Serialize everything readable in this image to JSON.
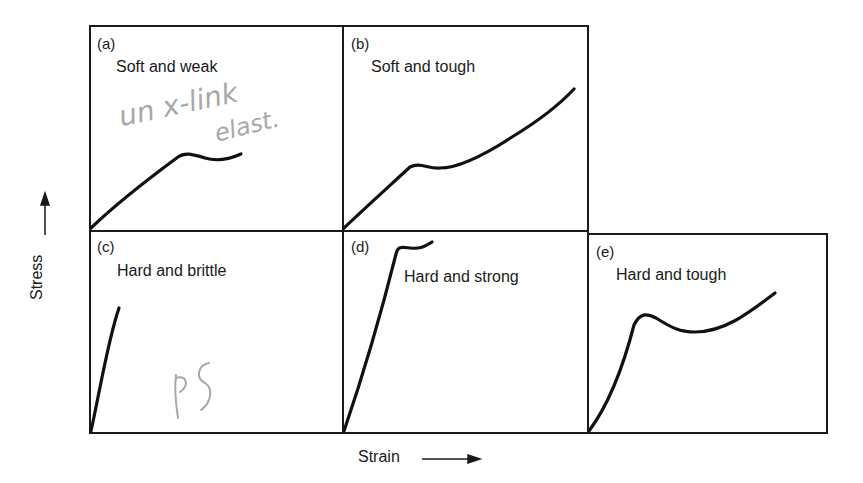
{
  "figure": {
    "x_axis_label": "Strain",
    "y_axis_label": "Stress",
    "panels": [
      {
        "id": "a",
        "label": "(a)",
        "title": "Soft and weak"
      },
      {
        "id": "b",
        "label": "(b)",
        "title": "Soft and tough"
      },
      {
        "id": "c",
        "label": "(c)",
        "title": "Hard and brittle"
      },
      {
        "id": "d",
        "label": "(d)",
        "title": "Hard and strong"
      },
      {
        "id": "e",
        "label": "(e)",
        "title": "Hard and tough"
      }
    ],
    "annotations": {
      "panel_a_handwriting_line1": "un x-link",
      "panel_a_handwriting_line2": "elast.",
      "panel_c_handwriting": "PS"
    },
    "colors": {
      "line": "#111111",
      "border": "#1a1a1a",
      "handwriting": "#a8a8a8"
    }
  }
}
